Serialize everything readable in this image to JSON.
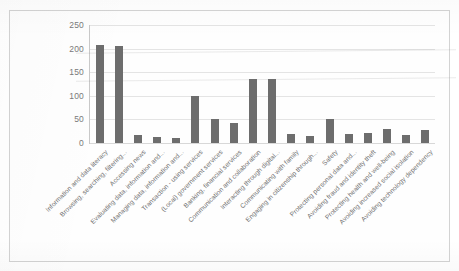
{
  "chart_data": {
    "type": "bar",
    "title": "",
    "subtitle": "",
    "xlabel": "",
    "ylabel": "",
    "ylim": [
      0,
      250
    ],
    "yticks": [
      0,
      50,
      100,
      150,
      200,
      250
    ],
    "grid": true,
    "legend": "none",
    "bar_color": "#6d6d6d",
    "gridline_color": "#e4e4e4",
    "axis_text_color": "#7a7a7a",
    "label_rotation_degrees": 45,
    "categories": [
      "Information and data literacy",
      "Browsing, searching, filtering...",
      "Accessing news",
      "Evaluating data, information and...",
      "Managing data, information and...",
      "Transaction - using services",
      "(Local) government services",
      "Banking, financial services",
      "Communication and collaboration",
      "Interacting through digital...",
      "Communicating with family",
      "Engaging in citizenship through...",
      "Safety",
      "Protecting personal data and...",
      "Avoiding fraud and identity theft",
      "Protecting health and well-being",
      "Avoiding increased social isolation",
      "Avoiding technology dependency"
    ],
    "values": [
      207,
      206,
      17,
      12,
      11,
      100,
      51,
      43,
      136,
      135,
      20,
      14,
      50,
      19,
      22,
      29,
      16,
      27
    ]
  }
}
